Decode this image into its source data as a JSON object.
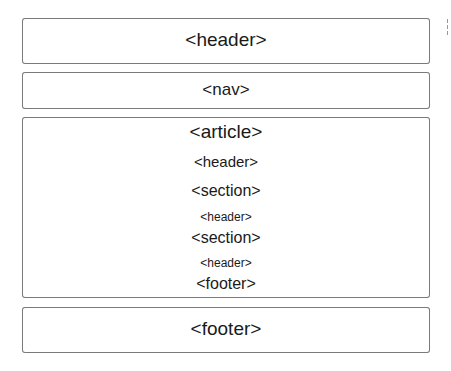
{
  "diagram": {
    "boxes": {
      "header": "<header>",
      "nav": "<nav>",
      "footer": "<footer>"
    },
    "article": {
      "label": "<article>",
      "items": [
        {
          "label": "<header>"
        },
        {
          "label": "<section>"
        },
        {
          "label": "<header>"
        },
        {
          "label": "<section>"
        },
        {
          "label": "<header>"
        },
        {
          "label": "<footer>"
        }
      ]
    },
    "colors": {
      "border": "#7a7a7a",
      "text": "#1a1a1a",
      "background": "#ffffff"
    }
  }
}
